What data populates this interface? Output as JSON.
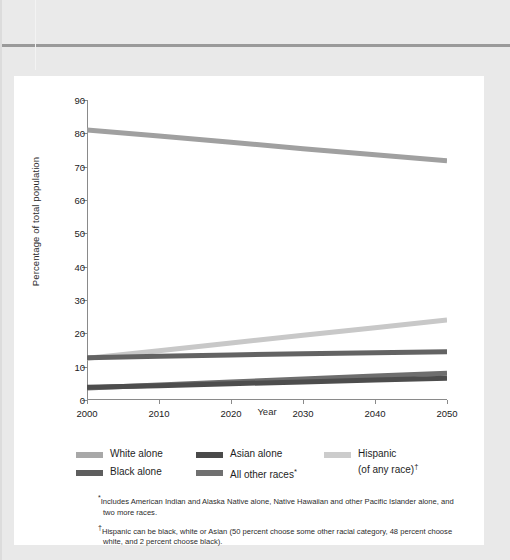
{
  "chart_data": {
    "type": "line",
    "title": "",
    "xlabel": "Year",
    "ylabel": "Percentage of total population",
    "xlim": [
      2000,
      2050
    ],
    "ylim": [
      0,
      90
    ],
    "xticks": [
      "2000",
      "2010",
      "2020",
      "2030",
      "2040",
      "2050"
    ],
    "yticks": [
      "0",
      "10",
      "20",
      "30",
      "40",
      "50",
      "60",
      "70",
      "80",
      "90"
    ],
    "grid": false,
    "legend_position": "below-plot",
    "x": [
      2000,
      2010,
      2020,
      2030,
      2040,
      2050
    ],
    "series": [
      {
        "name": "White alone",
        "color": "#a0a0a0",
        "values": [
          81.0,
          79.2,
          77.3,
          75.4,
          73.6,
          71.8
        ]
      },
      {
        "name": "Hispanic",
        "color": "#c8c8c8",
        "values": [
          12.5,
          14.8,
          17.1,
          19.4,
          21.7,
          24.0
        ]
      },
      {
        "name": "Black alone",
        "color": "#636363",
        "values": [
          12.7,
          13.1,
          13.5,
          13.9,
          14.2,
          14.5
        ]
      },
      {
        "name": "All other races",
        "color": "#6e6e6e",
        "values": [
          3.6,
          4.5,
          5.4,
          6.3,
          7.2,
          8.0
        ]
      },
      {
        "name": "Asian alone",
        "color": "#4d4d4d",
        "values": [
          3.8,
          4.3,
          4.9,
          5.4,
          6.0,
          6.5
        ]
      }
    ]
  },
  "legend": {
    "columns": [
      [
        {
          "label": "White alone",
          "color": "#a8a8a8",
          "marker": ""
        },
        {
          "label": "Black alone",
          "color": "#5e5e5e",
          "marker": ""
        }
      ],
      [
        {
          "label": "Asian alone",
          "color": "#4a4a4a",
          "marker": ""
        },
        {
          "label": "All other races",
          "color": "#707070",
          "marker": "*"
        }
      ],
      [
        {
          "label": "Hispanic",
          "label2": "(of any race)",
          "color": "#cccccc",
          "marker": "†"
        }
      ]
    ]
  },
  "footnotes": [
    {
      "marker": "*",
      "text": "Includes American Indian and Alaska Native alone, Native Hawaiian and other Pacific Islander alone, and two more races."
    },
    {
      "marker": "†",
      "text": "Hispanic can be black, white or Asian (50 percent choose some other racial category, 48 percent choose white, and 2 percent choose black)."
    }
  ]
}
